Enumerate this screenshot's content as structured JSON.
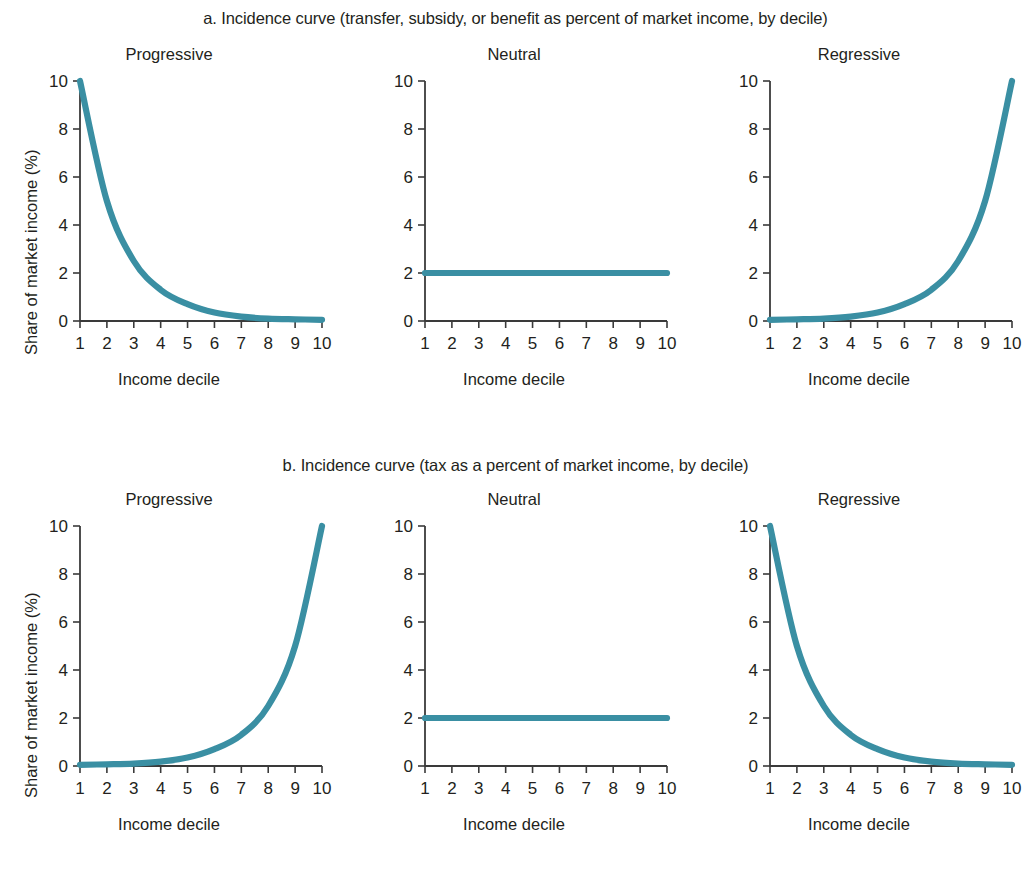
{
  "figure": {
    "blocks": [
      {
        "id": "a",
        "title": "a. Incidence curve (transfer, subsidy, or benefit as percent of market income, by decile)",
        "y_axis_title": "Share of market income (%)",
        "panels": [
          {
            "title": "Progressive",
            "x_axis_title": "Income decile"
          },
          {
            "title": "Neutral",
            "x_axis_title": "Income decile"
          },
          {
            "title": "Regressive",
            "x_axis_title": "Income decile"
          }
        ]
      },
      {
        "id": "b",
        "title": "b. Incidence curve (tax as a percent of market income, by decile)",
        "y_axis_title": "Share of market income (%)",
        "panels": [
          {
            "title": "Progressive",
            "x_axis_title": "Income decile"
          },
          {
            "title": "Neutral",
            "x_axis_title": "Income decile"
          },
          {
            "title": "Regressive",
            "x_axis_title": "Income decile"
          }
        ]
      }
    ]
  },
  "style": {
    "line_color": "#3a8fa3",
    "axis_color": "#3a3a3a",
    "text_color": "#231f20",
    "background": "#ffffff"
  },
  "chart_data": [
    {
      "type": "line",
      "panel_id": "a-progressive",
      "title": "Progressive",
      "block_title": "a. Incidence curve (transfer, subsidy, or benefit as percent of market income, by decile)",
      "xlabel": "Income decile",
      "ylabel": "Share of market income (%)",
      "xlim": [
        1,
        10
      ],
      "ylim": [
        0,
        10
      ],
      "xticks": [
        1,
        2,
        3,
        4,
        5,
        6,
        7,
        8,
        9,
        10
      ],
      "yticks": [
        0,
        2,
        4,
        6,
        8,
        10
      ],
      "grid": false,
      "legend": "none",
      "x": [
        1,
        2,
        3,
        4,
        5,
        6,
        7,
        8,
        9,
        10
      ],
      "values": [
        10,
        5,
        2.5,
        1.3,
        0.7,
        0.35,
        0.18,
        0.1,
        0.07,
        0.05
      ]
    },
    {
      "type": "line",
      "panel_id": "a-neutral",
      "title": "Neutral",
      "block_title": "a. Incidence curve (transfer, subsidy, or benefit as percent of market income, by decile)",
      "xlabel": "Income decile",
      "ylabel": "Share of market income (%)",
      "xlim": [
        1,
        10
      ],
      "ylim": [
        0,
        10
      ],
      "xticks": [
        1,
        2,
        3,
        4,
        5,
        6,
        7,
        8,
        9,
        10
      ],
      "yticks": [
        0,
        2,
        4,
        6,
        8,
        10
      ],
      "grid": false,
      "legend": "none",
      "x": [
        1,
        2,
        3,
        4,
        5,
        6,
        7,
        8,
        9,
        10
      ],
      "values": [
        2,
        2,
        2,
        2,
        2,
        2,
        2,
        2,
        2,
        2
      ]
    },
    {
      "type": "line",
      "panel_id": "a-regressive",
      "title": "Regressive",
      "block_title": "a. Incidence curve (transfer, subsidy, or benefit as percent of market income, by decile)",
      "xlabel": "Income decile",
      "ylabel": "Share of market income (%)",
      "xlim": [
        1,
        10
      ],
      "ylim": [
        0,
        10
      ],
      "xticks": [
        1,
        2,
        3,
        4,
        5,
        6,
        7,
        8,
        9,
        10
      ],
      "yticks": [
        0,
        2,
        4,
        6,
        8,
        10
      ],
      "grid": false,
      "legend": "none",
      "x": [
        1,
        2,
        3,
        4,
        5,
        6,
        7,
        8,
        9,
        10
      ],
      "values": [
        0.05,
        0.07,
        0.1,
        0.18,
        0.35,
        0.7,
        1.3,
        2.5,
        5,
        10
      ]
    },
    {
      "type": "line",
      "panel_id": "b-progressive",
      "title": "Progressive",
      "block_title": "b. Incidence curve (tax as a percent of market income, by decile)",
      "xlabel": "Income decile",
      "ylabel": "Share of market income (%)",
      "xlim": [
        1,
        10
      ],
      "ylim": [
        0,
        10
      ],
      "xticks": [
        1,
        2,
        3,
        4,
        5,
        6,
        7,
        8,
        9,
        10
      ],
      "yticks": [
        0,
        2,
        4,
        6,
        8,
        10
      ],
      "grid": false,
      "legend": "none",
      "x": [
        1,
        2,
        3,
        4,
        5,
        6,
        7,
        8,
        9,
        10
      ],
      "values": [
        0.05,
        0.07,
        0.1,
        0.18,
        0.35,
        0.7,
        1.3,
        2.5,
        5,
        10
      ]
    },
    {
      "type": "line",
      "panel_id": "b-neutral",
      "title": "Neutral",
      "block_title": "b. Incidence curve (tax as a percent of market income, by decile)",
      "xlabel": "Income decile",
      "ylabel": "Share of market income (%)",
      "xlim": [
        1,
        10
      ],
      "ylim": [
        0,
        10
      ],
      "xticks": [
        1,
        2,
        3,
        4,
        5,
        6,
        7,
        8,
        9,
        10
      ],
      "yticks": [
        0,
        2,
        4,
        6,
        8,
        10
      ],
      "grid": false,
      "legend": "none",
      "x": [
        1,
        2,
        3,
        4,
        5,
        6,
        7,
        8,
        9,
        10
      ],
      "values": [
        2,
        2,
        2,
        2,
        2,
        2,
        2,
        2,
        2,
        2
      ]
    },
    {
      "type": "line",
      "panel_id": "b-regressive",
      "title": "Regressive",
      "block_title": "b. Incidence curve (tax as a percent of market income, by decile)",
      "xlabel": "Income decile",
      "ylabel": "Share of market income (%)",
      "xlim": [
        1,
        10
      ],
      "ylim": [
        0,
        10
      ],
      "xticks": [
        1,
        2,
        3,
        4,
        5,
        6,
        7,
        8,
        9,
        10
      ],
      "yticks": [
        0,
        2,
        4,
        6,
        8,
        10
      ],
      "grid": false,
      "legend": "none",
      "x": [
        1,
        2,
        3,
        4,
        5,
        6,
        7,
        8,
        9,
        10
      ],
      "values": [
        10,
        5,
        2.5,
        1.3,
        0.7,
        0.35,
        0.18,
        0.1,
        0.07,
        0.05
      ]
    }
  ]
}
